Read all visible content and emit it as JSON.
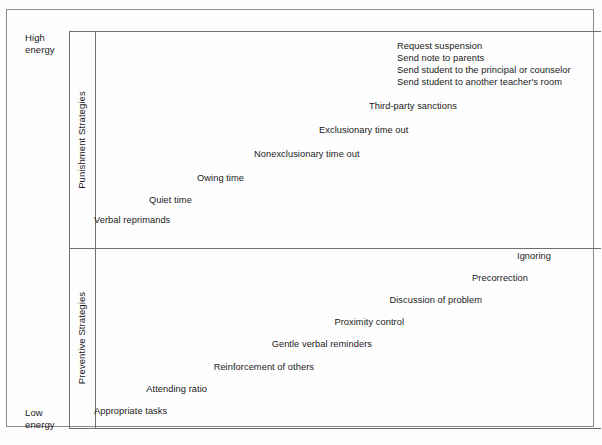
{
  "figure": {
    "type": "conceptual-diagram",
    "axis": {
      "label_top": "High\nenergy",
      "label_bottom": "Low\nenergy"
    },
    "bands": [
      {
        "id": "punishment",
        "label": "Punishment Strategies"
      },
      {
        "id": "preventive",
        "label": "Preventive Strategies"
      }
    ],
    "punishment_items": [
      {
        "label": "Request suspension",
        "x": 396,
        "y": 40,
        "align": "left"
      },
      {
        "label": "Send note to parents",
        "x": 396,
        "y": 52,
        "align": "left"
      },
      {
        "label": "Send student to the principal or counselor",
        "x": 396,
        "y": 64,
        "align": "left"
      },
      {
        "label": "Send student to another teacher's room",
        "x": 396,
        "y": 76,
        "align": "left"
      },
      {
        "label": "Third-party sanctions",
        "x": 368,
        "y": 100,
        "align": "left"
      },
      {
        "label": "Exclusionary time out",
        "x": 318,
        "y": 124,
        "align": "left"
      },
      {
        "label": "Nonexclusionary time out",
        "x": 253,
        "y": 148,
        "align": "left"
      },
      {
        "label": "Owing time",
        "x": 196,
        "y": 172,
        "align": "left"
      },
      {
        "label": "Quiet time",
        "x": 148,
        "y": 194,
        "align": "left"
      },
      {
        "label": "Verbal reprimands",
        "x": 93,
        "y": 214,
        "align": "left"
      }
    ],
    "preventive_items": [
      {
        "label": "Ignoring",
        "x": 552,
        "y": 250,
        "align": "right"
      },
      {
        "label": "Precorrection",
        "x": 529,
        "y": 272,
        "align": "right"
      },
      {
        "label": "Discussion of problem",
        "x": 483,
        "y": 294,
        "align": "right"
      },
      {
        "label": "Proximity control",
        "x": 405,
        "y": 316,
        "align": "right"
      },
      {
        "label": "Gentle verbal reminders",
        "x": 373,
        "y": 338,
        "align": "right"
      },
      {
        "label": "Reinforcement of others",
        "x": 315,
        "y": 361,
        "align": "right"
      },
      {
        "label": "Attending ratio",
        "x": 208,
        "y": 383,
        "align": "right"
      },
      {
        "label": "Appropriate tasks",
        "x": 93,
        "y": 405,
        "align": "left"
      }
    ],
    "colors": {
      "frame": "#8a8a8a",
      "grid": "#6f6f6f",
      "text": "#1a1a1a",
      "background": "#fefefe"
    }
  },
  "chart_data": {
    "type": "table",
    "title": "",
    "xlabel": "",
    "ylabel": "Energy",
    "axis_categories": [
      "High energy",
      "Low energy"
    ],
    "groups": [
      {
        "name": "Punishment Strategies",
        "values_low_to_high": [
          "Verbal reprimands",
          "Quiet time",
          "Owing time",
          "Nonexclusionary time out",
          "Exclusionary time out",
          "Third-party sanctions",
          "Send student to another teacher's room",
          "Send student to the principal or counselor",
          "Send note to parents",
          "Request suspension"
        ]
      },
      {
        "name": "Preventive Strategies",
        "values_low_to_high": [
          "Appropriate tasks",
          "Attending ratio",
          "Reinforcement of others",
          "Gentle verbal reminders",
          "Proximity control",
          "Discussion of problem",
          "Precorrection",
          "Ignoring"
        ]
      }
    ]
  }
}
